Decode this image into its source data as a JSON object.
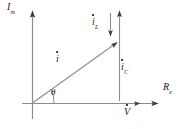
{
  "figure": {
    "background_color": "#ffffff",
    "line_color": "#6e6e6e",
    "text_color": "#1a1a1a"
  },
  "axes": {
    "vertical": {
      "label": "I",
      "subscript": "m",
      "name": "imaginary-axis",
      "arrow": "up"
    },
    "horizontal": {
      "label": "R",
      "subscript": "e",
      "name": "real-axis",
      "arrow": "right"
    },
    "origin": {
      "x": 32,
      "y": 103
    }
  },
  "vectors": [
    {
      "id": "i",
      "label": "i",
      "subscript": "",
      "overdot": true,
      "description": "total current phasor",
      "from": {
        "x": 32,
        "y": 103
      },
      "to": {
        "x": 119,
        "y": 41
      },
      "arrow": "to"
    },
    {
      "id": "iL",
      "label": "i",
      "subscript": "L",
      "overdot": true,
      "description": "inductive current component, downward",
      "from": {
        "x": 110,
        "y": 12
      },
      "to": {
        "x": 110,
        "y": 39
      },
      "arrow": "down"
    },
    {
      "id": "iC",
      "label": "i",
      "subscript": "C",
      "overdot": true,
      "description": "capacitive current component, upward",
      "from": {
        "x": 119,
        "y": 100
      },
      "to": {
        "x": 119,
        "y": 8
      },
      "arrow": "up"
    },
    {
      "id": "V",
      "label": "V",
      "subscript": "",
      "overdot": true,
      "description": "voltage phasor along real axis",
      "from": {
        "x": 119,
        "y": 103
      },
      "to": {
        "x": 143,
        "y": 103
      },
      "arrow": "right"
    }
  ],
  "angle": {
    "symbol": "θ",
    "name": "phase-angle",
    "between": [
      "real-axis",
      "i"
    ],
    "vertex": {
      "x": 32,
      "y": 103
    }
  }
}
